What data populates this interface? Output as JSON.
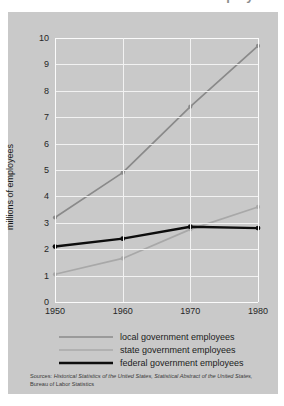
{
  "title": "...nt employees",
  "axis": {
    "ylabel": "millions of employees",
    "xlabel": "",
    "yticks": [
      "0",
      "1",
      "2",
      "3",
      "4",
      "5",
      "6",
      "7",
      "8",
      "9",
      "10"
    ],
    "xticks": [
      "1950",
      "1960",
      "1970",
      "1980"
    ]
  },
  "legend": [
    {
      "label": "local government employees",
      "color": "#8a8a8a"
    },
    {
      "label": "state government employees",
      "color": "#a8a8a8"
    },
    {
      "label": "federal government employees",
      "color": "#0d0d0d"
    }
  ],
  "source": {
    "prefix": "Sources:",
    "line1": "Historical Statistics of the United States, Statistical Abstract of the United States,",
    "line2": "Bureau of Labor Statistics"
  },
  "colors": {
    "panel": "#c9c9c9",
    "grid": "#f2f2f2",
    "page": "#ffffff",
    "local": "#8a8a8a",
    "state": "#a8a8a8",
    "federal": "#0d0d0d"
  },
  "chart_data": {
    "type": "line",
    "title": "...nt employees",
    "xlabel": "",
    "ylabel": "millions of employees",
    "x": [
      1950,
      1960,
      1970,
      1980
    ],
    "xlim": [
      1950,
      1980
    ],
    "ylim": [
      0,
      10
    ],
    "grid": true,
    "legend_position": "below",
    "series": [
      {
        "name": "local government employees",
        "color": "#8a8a8a",
        "values": [
          3.2,
          4.9,
          7.4,
          9.7
        ]
      },
      {
        "name": "state government employees",
        "color": "#a8a8a8",
        "values": [
          1.05,
          1.65,
          2.75,
          3.6
        ]
      },
      {
        "name": "federal government employees",
        "color": "#0d0d0d",
        "values": [
          2.1,
          2.4,
          2.85,
          2.8
        ]
      }
    ]
  }
}
